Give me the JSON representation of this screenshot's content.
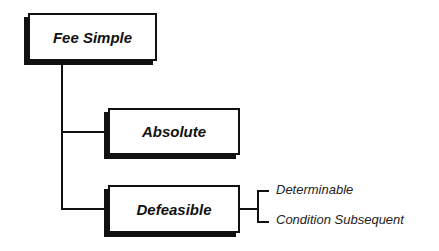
{
  "diagram": {
    "root": {
      "label": "Fee Simple"
    },
    "children": [
      {
        "label": "Absolute"
      },
      {
        "label": "Defeasible",
        "subtypes": [
          {
            "label": "Determinable"
          },
          {
            "label": "Condition Subsequent"
          }
        ]
      }
    ]
  },
  "colors": {
    "line": "#111111",
    "background": "#ffffff"
  }
}
